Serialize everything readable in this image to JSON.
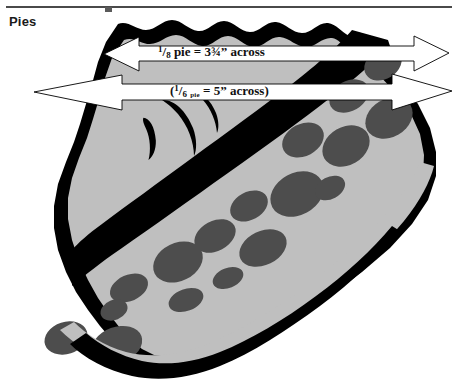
{
  "page": {
    "width": 458,
    "height": 387,
    "background": "#ffffff"
  },
  "header": {
    "rule_color": "#4a4a4a",
    "section_title": "Pies"
  },
  "figure": {
    "name": "pie-slice-illustration",
    "colors": {
      "crust": "#000000",
      "filling_body": "#bfbfbf",
      "fruit_chunks": "#4d4d4d",
      "background": "#ffffff",
      "arrow_fill": "#ffffff",
      "arrow_stroke": "#000000"
    }
  },
  "dimensions": [
    {
      "id": "eighth-pie",
      "numerator": "1",
      "slash": "/",
      "denominator": "8",
      "word": "pie",
      "equals": " = ",
      "value": "3¾” across",
      "full_text": "1/8 pie = 3¾” across",
      "arrow": {
        "left_tip_x": 104,
        "right_tip_x": 449,
        "center_y": 54,
        "double_headed": true
      }
    },
    {
      "id": "sixth-pie",
      "open_paren": "(",
      "numerator": "1",
      "slash": "/",
      "denominator": "6",
      "word": "pie",
      "equals": " = ",
      "value": "5” across",
      "close_paren": ")",
      "full_text": "(1/6 pie = 5” across)",
      "arrow": {
        "left_tip_x": 34,
        "right_tip_x": 452,
        "center_y": 92,
        "double_headed": true
      }
    }
  ]
}
